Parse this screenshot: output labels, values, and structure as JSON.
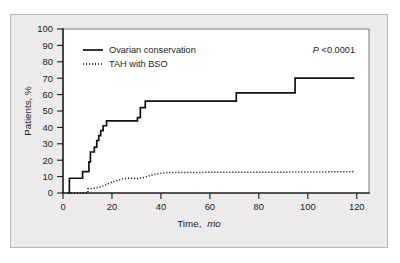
{
  "figure": {
    "panel_background": "#eceaea",
    "plot_background": "#ffffff",
    "border_color": "#b9b7b7"
  },
  "chart_data": {
    "type": "line",
    "subtype": "kaplan-meier-step",
    "title": "",
    "xlabel_main": "Time,",
    "xlabel_italic": "mo",
    "ylabel": "Patients, %",
    "xlim": [
      0,
      125
    ],
    "ylim": [
      0,
      100
    ],
    "xticks": [
      0,
      20,
      40,
      60,
      80,
      100,
      120
    ],
    "yticks": [
      0,
      10,
      20,
      30,
      40,
      50,
      60,
      70,
      80,
      90,
      100
    ],
    "grid": false,
    "legend_position": "top-left-inside",
    "annotations": [
      {
        "name": "p-value",
        "italic_part": "P",
        "rest": "<0.0001",
        "position": "top-right-inside"
      }
    ],
    "series": [
      {
        "name": "Ovarian conservation",
        "style": "solid",
        "color": "#111111",
        "points": [
          [
            2.0,
            0
          ],
          [
            2.6,
            0
          ],
          [
            2.6,
            9
          ],
          [
            8.0,
            9
          ],
          [
            8.0,
            13
          ],
          [
            10.6,
            13
          ],
          [
            10.6,
            19
          ],
          [
            11.2,
            19
          ],
          [
            11.2,
            25
          ],
          [
            12.8,
            25
          ],
          [
            12.8,
            28
          ],
          [
            13.8,
            28
          ],
          [
            13.8,
            32
          ],
          [
            14.6,
            32
          ],
          [
            14.6,
            35
          ],
          [
            15.4,
            35
          ],
          [
            15.4,
            38
          ],
          [
            16.4,
            38
          ],
          [
            16.4,
            41
          ],
          [
            17.8,
            41
          ],
          [
            17.8,
            44
          ],
          [
            30.4,
            44
          ],
          [
            30.4,
            46
          ],
          [
            31.6,
            46
          ],
          [
            31.6,
            52
          ],
          [
            33.6,
            52
          ],
          [
            33.6,
            56
          ],
          [
            70.8,
            56
          ],
          [
            70.8,
            61
          ],
          [
            94.8,
            61
          ],
          [
            94.8,
            70
          ],
          [
            119.0,
            70
          ]
        ]
      },
      {
        "name": "TAH with BSO",
        "style": "dotted",
        "color": "#111111",
        "points": [
          [
            2.0,
            0
          ],
          [
            10.2,
            0
          ],
          [
            10.2,
            2.6
          ],
          [
            13.0,
            3.0
          ],
          [
            15.0,
            3.6
          ],
          [
            17.0,
            4.6
          ],
          [
            19.0,
            6.0
          ],
          [
            21.0,
            7.2
          ],
          [
            23.0,
            8.0
          ],
          [
            25.0,
            8.8
          ],
          [
            27.0,
            9.0
          ],
          [
            29.0,
            8.8
          ],
          [
            31.0,
            8.8
          ],
          [
            33.0,
            9.4
          ],
          [
            35.0,
            10.4
          ],
          [
            37.0,
            11.2
          ],
          [
            39.0,
            11.8
          ],
          [
            41.0,
            12.2
          ],
          [
            43.0,
            12.5
          ],
          [
            50.0,
            12.5
          ],
          [
            60.0,
            12.6
          ],
          [
            70.0,
            12.6
          ],
          [
            80.0,
            12.7
          ],
          [
            90.0,
            12.7
          ],
          [
            100.0,
            12.8
          ],
          [
            110.0,
            12.9
          ],
          [
            119.0,
            13.0
          ]
        ]
      }
    ]
  }
}
